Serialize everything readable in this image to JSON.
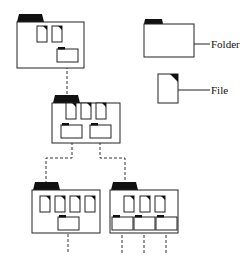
{
  "legend": {
    "folder_label": "Folder",
    "file_label": "File"
  },
  "tree": {
    "root": {
      "files": 2,
      "subfolders": 1
    },
    "level2": {
      "files": 3,
      "subfolders": 2
    },
    "level3": [
      {
        "files": 4,
        "subfolders": 1
      },
      {
        "files": 3,
        "subfolders": 3
      }
    ]
  },
  "colors": {
    "stroke": "#222222",
    "fill": "#ffffff",
    "tab": "#111111"
  }
}
